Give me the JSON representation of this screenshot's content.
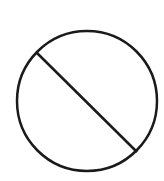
{
  "symbol": {
    "name": "prohibited",
    "stroke_color": "#1a1a1a",
    "background_color": "#ffffff"
  }
}
